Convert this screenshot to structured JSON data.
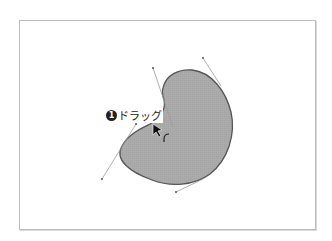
{
  "diagram": {
    "type": "bezier-shape-edit",
    "step_label": {
      "number": "1",
      "text": "ドラッグ"
    },
    "shape": {
      "fill": "#a9a9a9",
      "stroke": "#555555"
    },
    "handle_color": "#9a9a9a",
    "frame_border": "#bdbdbd",
    "cursor": "arrow-move-cursor"
  }
}
